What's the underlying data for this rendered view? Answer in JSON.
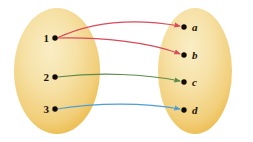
{
  "diagram": {
    "type": "set-mapping-diagram",
    "title": "",
    "domain_set": {
      "name": "domain-ellipse",
      "shape": "ellipse",
      "fill_center": "#f5e0a4",
      "fill_edge": "#edb84b",
      "cx": 57,
      "cy": 71,
      "rx": 43,
      "ry": 63,
      "elements": [
        {
          "label": "1",
          "dot_x": 55,
          "dot_y": 38,
          "label_x": 44,
          "label_y": 42
        },
        {
          "label": "2",
          "dot_x": 55,
          "dot_y": 77,
          "label_x": 44,
          "label_y": 81
        },
        {
          "label": "3",
          "dot_x": 55,
          "dot_y": 109,
          "label_x": 44,
          "label_y": 113
        }
      ]
    },
    "codomain_set": {
      "name": "codomain-ellipse",
      "shape": "ellipse",
      "fill_center": "#f5e0a4",
      "fill_edge": "#edb84b",
      "cx": 195,
      "cy": 71,
      "rx": 37,
      "ry": 63,
      "elements": [
        {
          "label": "a",
          "dot_x": 184,
          "dot_y": 27,
          "label_x": 192,
          "label_y": 31
        },
        {
          "label": "b",
          "dot_x": 184,
          "dot_y": 55,
          "label_x": 192,
          "label_y": 59
        },
        {
          "label": "c",
          "dot_x": 184,
          "dot_y": 82,
          "label_x": 192,
          "label_y": 86
        },
        {
          "label": "d",
          "dot_x": 184,
          "dot_y": 110,
          "label_x": 192,
          "label_y": 114
        }
      ]
    },
    "arrows": [
      {
        "name": "arrow-1-to-a",
        "from": "1",
        "to": "a",
        "color": "#d94a5a",
        "path": "M 57 38 C 95 20, 140 19, 180 26"
      },
      {
        "name": "arrow-1-to-b",
        "from": "1",
        "to": "b",
        "color": "#d94a5a",
        "path": "M 57 38 C 100 37, 150 42, 180 54"
      },
      {
        "name": "arrow-2-to-c",
        "from": "2",
        "to": "c",
        "color": "#5d8c4a",
        "path": "M 57 77 C 100 72, 145 74, 180 81"
      },
      {
        "name": "arrow-3-to-d",
        "from": "3",
        "to": "d",
        "color": "#4d9fd4",
        "path": "M 57 109 C 100 102, 145 103, 180 109"
      }
    ],
    "dot_radius": 2.7,
    "background": "#ffffff"
  }
}
